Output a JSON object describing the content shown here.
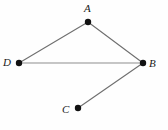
{
  "figure": {
    "width": 168,
    "height": 130,
    "background_color": "#fefefe"
  },
  "points": [
    {
      "label": "A",
      "x": 88,
      "y": 22,
      "label_x": 84,
      "label_y": 3,
      "dot_radius": 3.2,
      "color": "#111111"
    },
    {
      "label": "B",
      "x": 143,
      "y": 63,
      "label_x": 149,
      "label_y": 58,
      "dot_radius": 3.2,
      "color": "#111111"
    },
    {
      "label": "C",
      "x": 78,
      "y": 108,
      "label_x": 62,
      "label_y": 104,
      "dot_radius": 3.2,
      "color": "#111111"
    },
    {
      "label": "D",
      "x": 19,
      "y": 63,
      "label_x": 3,
      "label_y": 57,
      "dot_radius": 3.2,
      "color": "#111111"
    }
  ],
  "segments": [
    {
      "name": "segment-DA",
      "from": "D",
      "to": "A",
      "x1": 19,
      "y1": 63,
      "x2": 88,
      "y2": 22,
      "color": "#6f6f6f",
      "width": 1.1
    },
    {
      "name": "segment-AB",
      "from": "A",
      "to": "B",
      "x1": 88,
      "y1": 22,
      "x2": 143,
      "y2": 63,
      "color": "#6f6f6f",
      "width": 1.1
    },
    {
      "name": "segment-DB",
      "from": "D",
      "to": "B",
      "x1": 19,
      "y1": 63,
      "x2": 143,
      "y2": 63,
      "color": "#8d8d8d",
      "width": 1.0
    },
    {
      "name": "segment-BC",
      "from": "B",
      "to": "C",
      "x1": 143,
      "y1": 63,
      "x2": 78,
      "y2": 108,
      "color": "#6f6f6f",
      "width": 1.1
    }
  ],
  "colors": {
    "vertex": "#111111",
    "edge_dark": "#6f6f6f",
    "edge_light": "#8d8d8d",
    "label_text": "#1a1a1a",
    "background": "#fefefe"
  }
}
